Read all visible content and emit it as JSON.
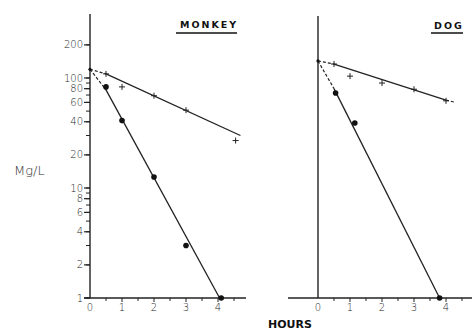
{
  "chart_data": {
    "type": "scatter",
    "scale": "semi-log",
    "ylabel": "Mg/L",
    "xlabel": "HOURS",
    "y_ticks_labeled": [
      1,
      2,
      4,
      6,
      8,
      10,
      20,
      40,
      60,
      80,
      100,
      200
    ],
    "y_ticks_minor": [
      3,
      30
    ],
    "ylim": [
      1,
      300
    ],
    "panels": [
      {
        "title": "MONKEY",
        "x_ticks": [
          0,
          1,
          2,
          3,
          4
        ],
        "xlim": [
          0,
          4.9
        ],
        "series": [
          {
            "name": "plus",
            "marker": "+",
            "points": [
              [
                0.5,
                109
              ],
              [
                1,
                83
              ],
              [
                2,
                69
              ],
              [
                3,
                51
              ],
              [
                4.55,
                27
              ]
            ],
            "fit_line": {
              "dashed": [
                [
                  0,
                  120
                ],
                [
                  0.5,
                  109
                ]
              ],
              "solid": [
                [
                  0.5,
                  109
                ],
                [
                  4.7,
                  30
                ]
              ]
            }
          },
          {
            "name": "dot",
            "marker": "●",
            "points": [
              [
                0.5,
                83
              ],
              [
                1,
                41
              ],
              [
                2,
                12.6
              ],
              [
                3,
                3.0
              ],
              [
                4.1,
                1.0
              ]
            ],
            "fit_line": {
              "dashed": [
                [
                  0,
                  120
                ],
                [
                  0.5,
                  78
                ]
              ],
              "solid": [
                [
                  0.5,
                  78
                ],
                [
                  4.05,
                  1.0
                ]
              ]
            }
          }
        ]
      },
      {
        "title": "DOG",
        "x_ticks": [
          0,
          1,
          2,
          3,
          4
        ],
        "xlim": [
          0,
          4.8
        ],
        "series": [
          {
            "name": "plus",
            "marker": "+",
            "points": [
              [
                0.5,
                134
              ],
              [
                1,
                104
              ],
              [
                2,
                90
              ],
              [
                3,
                79
              ],
              [
                4,
                62
              ]
            ],
            "fit_line": {
              "dashed": [
                [
                  0,
                  143
                ],
                [
                  0.5,
                  134
                ],
                [
                  4,
                  63
                ],
                [
                  4.3,
                  60
                ]
              ],
              "solid": [
                [
                  0.5,
                  134
                ],
                [
                  4,
                  63
                ]
              ]
            }
          },
          {
            "name": "dot",
            "marker": "●",
            "points": [
              [
                0.55,
                73
              ],
              [
                1.15,
                39
              ],
              [
                3.8,
                1.0
              ]
            ],
            "fit_line": {
              "dashed": [
                [
                  0,
                  143
                ],
                [
                  0.5,
                  80
                ]
              ],
              "solid": [
                [
                  0.5,
                  80
                ],
                [
                  3.8,
                  1.0
                ]
              ]
            }
          }
        ]
      }
    ]
  },
  "labels": {
    "ylabel": "Mg/L",
    "xlabel": "HOURS",
    "monkey_title": "MONKEY",
    "dog_title": "DOG"
  }
}
